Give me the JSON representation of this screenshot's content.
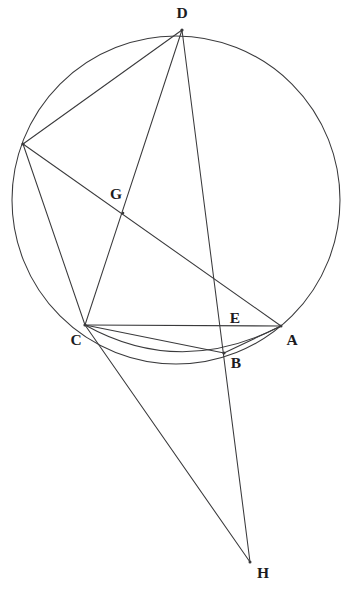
{
  "figure": {
    "background_color": "#ffffff",
    "line_color": "#3a3a3c",
    "label_color": "#1c1c1e",
    "width": 349,
    "height": 603
  },
  "circle": {
    "name": "main-circumcircle",
    "cx": 176,
    "cy": 200,
    "r": 164
  },
  "arc": {
    "name": "arc-c-to-a",
    "from": "C",
    "to": "A",
    "d": "M 85 325 Q 180 378 281 326"
  },
  "points": [
    {
      "id": "D",
      "label": "D",
      "x": 182,
      "y": 30,
      "lx": 182,
      "ly": 14,
      "labeled": true
    },
    {
      "id": "F",
      "label": "",
      "x": 23,
      "y": 144,
      "lx": 23,
      "ly": 144,
      "labeled": false
    },
    {
      "id": "G",
      "label": "G",
      "x": 123,
      "y": 213,
      "lx": 116,
      "ly": 195,
      "labeled": true
    },
    {
      "id": "C",
      "label": "C",
      "x": 85,
      "y": 325,
      "lx": 76,
      "ly": 341,
      "labeled": true
    },
    {
      "id": "E",
      "label": "E",
      "x": 224,
      "y": 326,
      "lx": 235,
      "ly": 319,
      "labeled": true
    },
    {
      "id": "A",
      "label": "A",
      "x": 281,
      "y": 326,
      "lx": 292,
      "ly": 341,
      "labeled": true
    },
    {
      "id": "B",
      "label": "B",
      "x": 224,
      "y": 353,
      "lx": 236,
      "ly": 364,
      "labeled": true
    },
    {
      "id": "H",
      "label": "H",
      "x": 250,
      "y": 562,
      "lx": 263,
      "ly": 574,
      "labeled": true
    }
  ],
  "segments": [
    {
      "name": "segment-F-D",
      "from": "F",
      "to": "D",
      "x1": 23,
      "y1": 144,
      "x2": 182,
      "y2": 30
    },
    {
      "name": "segment-D-C",
      "from": "D",
      "to": "C",
      "x1": 182,
      "y1": 30,
      "x2": 85,
      "y2": 325
    },
    {
      "name": "segment-D-H",
      "from": "D",
      "to": "H",
      "x1": 182,
      "y1": 30,
      "x2": 250,
      "y2": 562
    },
    {
      "name": "segment-F-C",
      "from": "F",
      "to": "C",
      "x1": 23,
      "y1": 144,
      "x2": 85,
      "y2": 325
    },
    {
      "name": "segment-F-A",
      "from": "F",
      "to": "A",
      "x1": 23,
      "y1": 144,
      "x2": 281,
      "y2": 326
    },
    {
      "name": "segment-C-A",
      "from": "C",
      "to": "A",
      "x1": 85,
      "y1": 325,
      "x2": 281,
      "y2": 326
    },
    {
      "name": "segment-C-B",
      "from": "C",
      "to": "B",
      "x1": 85,
      "y1": 325,
      "x2": 224,
      "y2": 353
    },
    {
      "name": "segment-B-A",
      "from": "B",
      "to": "A",
      "x1": 224,
      "y1": 353,
      "x2": 281,
      "y2": 326
    },
    {
      "name": "segment-C-H",
      "from": "C",
      "to": "H",
      "x1": 85,
      "y1": 325,
      "x2": 250,
      "y2": 562
    }
  ]
}
